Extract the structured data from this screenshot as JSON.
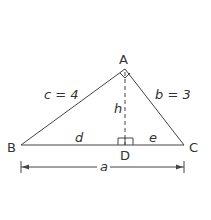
{
  "diagram": {
    "type": "right-triangle-altitude",
    "vertices": {
      "A": {
        "label": "A",
        "x": 125,
        "y": 69
      },
      "B": {
        "label": "B",
        "x": 21,
        "y": 145
      },
      "C": {
        "label": "C",
        "x": 184,
        "y": 145
      },
      "D": {
        "label": "D",
        "x": 125,
        "y": 145
      }
    },
    "sides": {
      "c": {
        "label": "c = 4"
      },
      "b": {
        "label": "b = 3"
      },
      "a": {
        "label": "a"
      },
      "h": {
        "label": "h"
      },
      "d": {
        "label": "d"
      },
      "e": {
        "label": "e"
      }
    },
    "right_angles": [
      "A",
      "D"
    ],
    "colors": {
      "stroke": "#444444",
      "text": "#333333",
      "background": "#ffffff"
    }
  }
}
